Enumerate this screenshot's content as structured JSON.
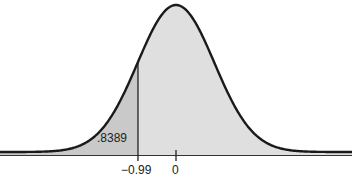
{
  "chart_data": {
    "type": "area",
    "title": "",
    "xlabel": "",
    "ylabel": "",
    "distribution": "standard normal",
    "mean": 0,
    "sd": 1,
    "x_ticks": [
      -0.99,
      0
    ],
    "x_tick_labels": [
      "−0.99",
      "0"
    ],
    "shaded_regions": [
      {
        "from": "-inf",
        "to": -0.99,
        "shade": "dark",
        "color": "#c8c8c8"
      },
      {
        "from": -0.99,
        "to": "inf",
        "shade": "light",
        "color": "#dedede"
      }
    ],
    "annotations": [
      {
        "text": ".8389",
        "position": "left tail region"
      }
    ],
    "grid": false,
    "legend": false
  },
  "labels": {
    "area_value": ".8389",
    "tick_z": "−0.99",
    "tick_zero": "0",
    "caption": ""
  },
  "colors": {
    "curve": "#1a1a1a",
    "left_fill": "#c9c9c9",
    "right_fill": "#dfdfdf",
    "baseline": "#333333"
  }
}
